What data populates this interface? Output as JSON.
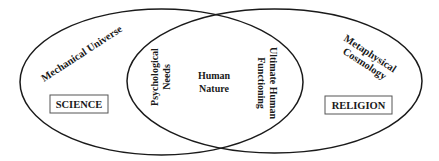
{
  "diagram": {
    "type": "venn",
    "left_set": {
      "arc_label": "Mechanical Universe",
      "box_label": "SCIENCE"
    },
    "right_set": {
      "arc_label_line1": "Metaphysical",
      "arc_label_line2": "Cosmology",
      "box_label": "RELIGION"
    },
    "intersection": {
      "left_label_line1": "Psychological",
      "left_label_line2": "Needs",
      "center_label_line1": "Human",
      "center_label_line2": "Nature",
      "right_label_line1": "Ultimate Human",
      "right_label_line2": "Functioning"
    },
    "colors": {
      "stroke": "#1a1a1a",
      "box_stroke": "#555555",
      "background": "#ffffff"
    }
  }
}
